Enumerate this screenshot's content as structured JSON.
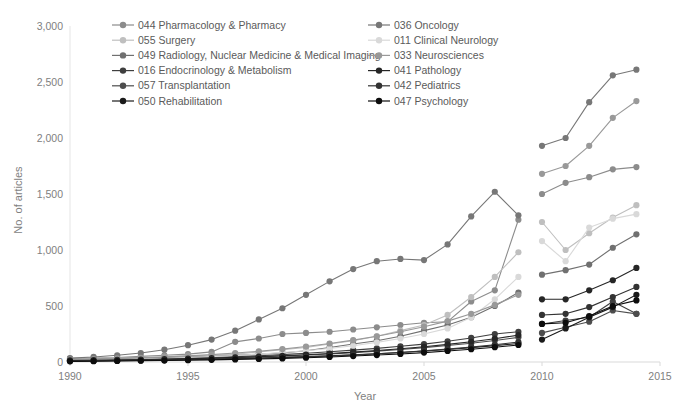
{
  "chart_data": {
    "type": "line",
    "title": "",
    "xlabel": "Year",
    "ylabel": "No. of articles",
    "xlim": [
      1990,
      2015
    ],
    "ylim": [
      0,
      3000
    ],
    "xticks": [
      1990,
      1995,
      2000,
      2005,
      2010,
      2015
    ],
    "xtick_labels": [
      "1990",
      "1995",
      "2000",
      "2005",
      "2010",
      "2015"
    ],
    "yticks": [
      0,
      500,
      1000,
      1500,
      2000,
      2500,
      3000
    ],
    "ytick_labels": [
      "0",
      "500",
      "1,000",
      "1,500",
      "2,000",
      "2,500",
      "3,000"
    ],
    "grid": false,
    "legend_position": "top-inside",
    "note": "Two detached groups of observations: 1990-2009 and 2010-2014",
    "x_left": [
      1990,
      1991,
      1992,
      1993,
      1994,
      1995,
      1996,
      1997,
      1998,
      1999,
      2000,
      2001,
      2002,
      2003,
      2004,
      2005,
      2006,
      2007,
      2008,
      2009
    ],
    "x_right": [
      2010,
      2011,
      2012,
      2013,
      2014
    ],
    "series": [
      {
        "name": "044 Pharmacology & Pharmacy",
        "code": "044",
        "color": "#8c8c8c",
        "values_left": [
          30,
          35,
          40,
          50,
          60,
          70,
          90,
          180,
          210,
          250,
          260,
          270,
          290,
          310,
          330,
          350,
          360,
          540,
          640,
          1270
        ],
        "values_right": [
          1500,
          1600,
          1650,
          1720,
          1740
        ]
      },
      {
        "name": "055 Surgery",
        "code": "055",
        "color": "#bfbfbf",
        "values_left": [
          25,
          30,
          35,
          40,
          45,
          55,
          60,
          70,
          90,
          110,
          130,
          160,
          190,
          230,
          280,
          330,
          420,
          580,
          760,
          980
        ],
        "values_right": [
          1250,
          1000,
          1150,
          1290,
          1400
        ]
      },
      {
        "name": "049 Radiology, Nuclear Medicine & Medical Imaging",
        "code": "049",
        "color": "#707070",
        "values_left": [
          20,
          25,
          30,
          35,
          40,
          45,
          50,
          60,
          70,
          80,
          100,
          130,
          160,
          190,
          230,
          280,
          330,
          400,
          500,
          620
        ],
        "values_right": [
          780,
          820,
          870,
          1020,
          1140
        ]
      },
      {
        "name": "016 Endocrinology & Metabolism",
        "code": "016",
        "color": "#3f3f3f",
        "values_left": [
          15,
          18,
          22,
          26,
          30,
          35,
          40,
          48,
          56,
          66,
          78,
          92,
          106,
          122,
          140,
          160,
          185,
          215,
          250,
          270
        ],
        "values_right": [
          340,
          370,
          400,
          540,
          430
        ]
      },
      {
        "name": "057 Transplantation",
        "code": "057",
        "color": "#4d4d4d",
        "values_left": [
          12,
          14,
          17,
          20,
          24,
          28,
          33,
          38,
          45,
          53,
          62,
          72,
          84,
          97,
          112,
          128,
          147,
          168,
          192,
          220
        ],
        "values_right": [
          260,
          310,
          360,
          460,
          430
        ]
      },
      {
        "name": "050 Rehabilitation",
        "code": "050",
        "color": "#1a1a1a",
        "values_left": [
          10,
          12,
          14,
          17,
          20,
          23,
          27,
          31,
          36,
          42,
          48,
          56,
          64,
          74,
          85,
          98,
          112,
          128,
          146,
          165
        ],
        "values_right": [
          200,
          300,
          400,
          490,
          600
        ]
      },
      {
        "name": "036 Oncology",
        "code": "036",
        "color": "#777777",
        "values_left": [
          35,
          45,
          60,
          80,
          110,
          150,
          200,
          280,
          380,
          480,
          600,
          720,
          830,
          900,
          920,
          910,
          1050,
          1300,
          1520,
          1310
        ],
        "values_right": [
          1930,
          2000,
          2320,
          2560,
          2610
        ]
      },
      {
        "name": "011 Clinical Neurology",
        "code": "011",
        "color": "#d9d9d9",
        "values_left": [
          18,
          20,
          24,
          28,
          34,
          40,
          48,
          58,
          70,
          85,
          100,
          120,
          145,
          175,
          210,
          250,
          300,
          400,
          560,
          760
        ],
        "values_right": [
          1080,
          900,
          1200,
          1280,
          1320
        ]
      },
      {
        "name": "033 Neurosciences",
        "code": "033",
        "color": "#999999",
        "values_left": [
          22,
          26,
          32,
          38,
          46,
          55,
          66,
          80,
          96,
          115,
          138,
          165,
          195,
          230,
          270,
          315,
          365,
          430,
          510,
          600
        ],
        "values_right": [
          1680,
          1750,
          1930,
          2180,
          2330
        ]
      },
      {
        "name": "041 Pathology",
        "code": "041",
        "color": "#262626",
        "values_left": [
          14,
          16,
          19,
          22,
          26,
          30,
          35,
          41,
          48,
          56,
          65,
          76,
          88,
          102,
          118,
          136,
          157,
          181,
          208,
          240
        ],
        "values_right": [
          560,
          560,
          640,
          730,
          840
        ]
      },
      {
        "name": "042 Pediatrics",
        "code": "042",
        "color": "#333333",
        "values_left": [
          8,
          10,
          12,
          14,
          17,
          20,
          24,
          28,
          33,
          39,
          46,
          54,
          63,
          73,
          85,
          99,
          115,
          133,
          154,
          178
        ],
        "values_right": [
          420,
          430,
          490,
          580,
          670
        ]
      },
      {
        "name": "047 Psychology",
        "code": "047",
        "color": "#0d0d0d",
        "values_left": [
          6,
          7,
          9,
          11,
          13,
          16,
          19,
          23,
          27,
          32,
          38,
          45,
          53,
          62,
          72,
          84,
          98,
          114,
          132,
          152
        ],
        "values_right": [
          340,
          350,
          410,
          500,
          550
        ]
      }
    ]
  },
  "legend": {
    "column_left": [
      "044 Pharmacology & Pharmacy",
      "055 Surgery",
      "049 Radiology, Nuclear Medicine & Medical Imaging",
      "016 Endocrinology & Metabolism",
      "057 Transplantation",
      "050 Rehabilitation"
    ],
    "column_right": [
      "036 Oncology",
      "011 Clinical Neurology",
      "033 Neurosciences",
      "041 Pathology",
      "042 Pediatrics",
      "047 Psychology"
    ]
  }
}
